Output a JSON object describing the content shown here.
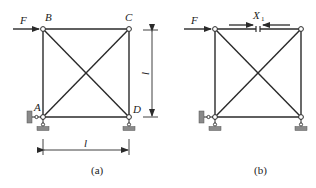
{
  "figures": [
    {
      "id": "a",
      "caption": "(a)",
      "nodes": {
        "A": "A",
        "B": "B",
        "C": "C",
        "D": "D"
      },
      "load_label": "F",
      "dimension_vertical": "l",
      "dimension_horizontal": "l"
    },
    {
      "id": "b",
      "caption": "(b)",
      "load_label": "F",
      "redundant_label": "X",
      "redundant_subscript": "1"
    }
  ],
  "colors": {
    "line": "#2a2a2a",
    "support_fill": "#8a8a8a",
    "background": "#ffffff"
  }
}
